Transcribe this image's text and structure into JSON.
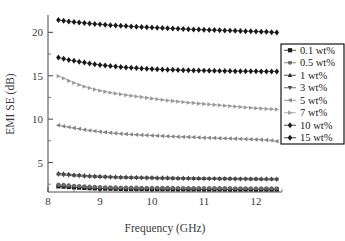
{
  "chart_data": {
    "type": "line",
    "title": "",
    "xlabel": "Frequency (GHz)",
    "ylabel": "EMI SE (dB)",
    "xlim": [
      8.0,
      12.5
    ],
    "ylim": [
      1.6,
      22.0
    ],
    "xticks": [
      8,
      9,
      10,
      11,
      12
    ],
    "yticks": [
      5,
      10,
      15,
      20
    ],
    "grid": false,
    "legend_position": "right-outside",
    "x": [
      8.2,
      8.3,
      8.4,
      8.5,
      8.6,
      8.7,
      8.8,
      8.9,
      9.0,
      9.1,
      9.2,
      9.3,
      9.4,
      9.5,
      9.6,
      9.7,
      9.8,
      9.9,
      10.0,
      10.1,
      10.2,
      10.3,
      10.4,
      10.5,
      10.6,
      10.7,
      10.8,
      10.9,
      11.0,
      11.1,
      11.2,
      11.3,
      11.4,
      11.5,
      11.6,
      11.7,
      11.8,
      11.9,
      12.0,
      12.1,
      12.2,
      12.3,
      12.4
    ],
    "series": [
      {
        "name": "0.1 wt%",
        "marker": "square",
        "color": "#1a1a1a",
        "values": [
          2.25,
          2.22,
          2.18,
          2.14,
          2.1,
          2.07,
          2.04,
          2.02,
          2.0,
          1.99,
          1.98,
          1.97,
          1.96,
          1.95,
          1.95,
          1.94,
          1.94,
          1.93,
          1.93,
          1.92,
          1.92,
          1.92,
          1.91,
          1.91,
          1.91,
          1.9,
          1.9,
          1.9,
          1.9,
          1.89,
          1.89,
          1.89,
          1.89,
          1.88,
          1.88,
          1.88,
          1.88,
          1.88,
          1.87,
          1.87,
          1.87,
          1.87,
          1.87
        ]
      },
      {
        "name": "0.5 wt%",
        "marker": "circle",
        "color": "#6a6a6a",
        "values": [
          2.45,
          2.41,
          2.36,
          2.32,
          2.28,
          2.24,
          2.21,
          2.19,
          2.17,
          2.15,
          2.14,
          2.13,
          2.12,
          2.11,
          2.1,
          2.1,
          2.09,
          2.09,
          2.08,
          2.08,
          2.07,
          2.07,
          2.07,
          2.06,
          2.06,
          2.06,
          2.05,
          2.05,
          2.05,
          2.05,
          2.04,
          2.04,
          2.04,
          2.04,
          2.03,
          2.03,
          2.03,
          2.03,
          2.03,
          2.02,
          2.02,
          2.02,
          2.02
        ]
      },
      {
        "name": "1 wt%",
        "marker": "triangle-up",
        "color": "#2a2a2a",
        "values": [
          3.75,
          3.7,
          3.65,
          3.6,
          3.56,
          3.52,
          3.48,
          3.45,
          3.42,
          3.4,
          3.38,
          3.36,
          3.34,
          3.33,
          3.31,
          3.3,
          3.29,
          3.28,
          3.27,
          3.26,
          3.25,
          3.24,
          3.23,
          3.22,
          3.21,
          3.21,
          3.2,
          3.19,
          3.19,
          3.18,
          3.18,
          3.17,
          3.17,
          3.16,
          3.16,
          3.15,
          3.15,
          3.14,
          3.14,
          3.13,
          3.13,
          3.12,
          3.12
        ]
      },
      {
        "name": "3 wt%",
        "marker": "triangle-down",
        "color": "#4a4a4a",
        "values": [
          3.6,
          3.56,
          3.51,
          3.47,
          3.43,
          3.39,
          3.36,
          3.33,
          3.31,
          3.29,
          3.27,
          3.25,
          3.24,
          3.22,
          3.21,
          3.2,
          3.19,
          3.18,
          3.17,
          3.16,
          3.15,
          3.15,
          3.14,
          3.13,
          3.12,
          3.12,
          3.11,
          3.11,
          3.1,
          3.1,
          3.09,
          3.09,
          3.08,
          3.08,
          3.07,
          3.07,
          3.06,
          3.06,
          3.06,
          3.05,
          3.05,
          3.05,
          3.04
        ]
      },
      {
        "name": "5 wt%",
        "marker": "triangle-left",
        "color": "#858585",
        "values": [
          9.3,
          9.18,
          9.08,
          8.98,
          8.88,
          8.78,
          8.7,
          8.62,
          8.55,
          8.48,
          8.42,
          8.37,
          8.32,
          8.28,
          8.24,
          8.2,
          8.17,
          8.14,
          8.11,
          8.08,
          8.05,
          8.02,
          8.0,
          7.97,
          7.95,
          7.93,
          7.91,
          7.88,
          7.86,
          7.84,
          7.82,
          7.8,
          7.78,
          7.76,
          7.74,
          7.72,
          7.7,
          7.68,
          7.66,
          7.63,
          7.6,
          7.55,
          7.45
        ]
      },
      {
        "name": "7 wt%",
        "marker": "triangle-right",
        "color": "#9a9a9a",
        "values": [
          14.95,
          14.7,
          14.42,
          14.18,
          13.95,
          13.75,
          13.58,
          13.42,
          13.28,
          13.16,
          13.05,
          12.95,
          12.86,
          12.77,
          12.69,
          12.61,
          12.54,
          12.46,
          12.38,
          12.3,
          12.22,
          12.15,
          12.08,
          12.02,
          11.96,
          11.9,
          11.85,
          11.8,
          11.75,
          11.7,
          11.65,
          11.6,
          11.55,
          11.5,
          11.45,
          11.4,
          11.35,
          11.3,
          11.26,
          11.22,
          11.18,
          11.15,
          11.12
        ]
      },
      {
        "name": "10 wt%",
        "marker": "diamond",
        "color": "#1a1a1a",
        "values": [
          17.1,
          16.95,
          16.82,
          16.72,
          16.62,
          16.52,
          16.42,
          16.33,
          16.25,
          16.18,
          16.12,
          16.06,
          16.01,
          15.96,
          15.92,
          15.88,
          15.84,
          15.81,
          15.78,
          15.75,
          15.72,
          15.7,
          15.68,
          15.66,
          15.64,
          15.62,
          15.61,
          15.6,
          15.59,
          15.58,
          15.57,
          15.56,
          15.55,
          15.54,
          15.53,
          15.52,
          15.52,
          15.51,
          15.51,
          15.5,
          15.5,
          15.5,
          15.5
        ]
      },
      {
        "name": "15 wt%",
        "marker": "diamond",
        "color": "#1a1a1a",
        "values": [
          21.42,
          21.34,
          21.26,
          21.2,
          21.14,
          21.08,
          21.02,
          20.97,
          20.92,
          20.87,
          20.83,
          20.79,
          20.75,
          20.72,
          20.68,
          20.65,
          20.62,
          20.59,
          20.56,
          20.53,
          20.5,
          20.47,
          20.44,
          20.42,
          20.39,
          20.37,
          20.34,
          20.32,
          20.3,
          20.28,
          20.26,
          20.24,
          20.22,
          20.2,
          20.18,
          20.16,
          20.14,
          20.12,
          20.1,
          20.08,
          20.06,
          20.02,
          19.98
        ]
      }
    ]
  },
  "legend": {
    "entries": [
      "0.1 wt%",
      "0.5 wt%",
      "1 wt%",
      "3 wt%",
      "5 wt%",
      "7 wt%",
      "10 wt%",
      "15 wt%"
    ]
  },
  "axes": {
    "x_tick_labels": [
      "8",
      "9",
      "10",
      "11",
      "12"
    ],
    "y_tick_labels": [
      "5",
      "10",
      "15",
      "20"
    ]
  },
  "colors": {
    "axis": "#555555",
    "text": "#3a3a3a",
    "background": "#ffffff",
    "legend_border": "#000000"
  }
}
